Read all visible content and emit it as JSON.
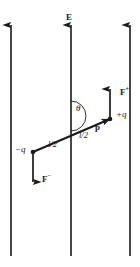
{
  "figure": {
    "background_color": "#ffffff",
    "stroke_color": "#1a1a1a",
    "width": 140,
    "height": 267,
    "field": {
      "label": "E",
      "line_count": 3,
      "line_x": [
        11,
        71,
        130
      ],
      "line_top": 22,
      "line_bottom": 256,
      "direction": "up"
    },
    "dipole": {
      "tail_x": 33,
      "tail_y": 152,
      "head_x": 110,
      "head_y": 119,
      "moment_label": "p",
      "angle_label": "θ",
      "arm_label_1": "l/2",
      "arm_label_2": "l/2"
    },
    "charges": {
      "positive_label": "+q",
      "positive_x": 110,
      "positive_y": 119,
      "negative_label": "−q",
      "negative_x": 33,
      "negative_y": 152
    },
    "forces": {
      "positive": {
        "label_base": "F",
        "label_sup": "+",
        "x": 110,
        "y_from": 118,
        "y_to": 88,
        "direction": "up"
      },
      "negative": {
        "label_base": "F",
        "label_sup": "−",
        "x": 33,
        "y_from": 153,
        "y_to": 183,
        "direction": "down"
      }
    }
  }
}
